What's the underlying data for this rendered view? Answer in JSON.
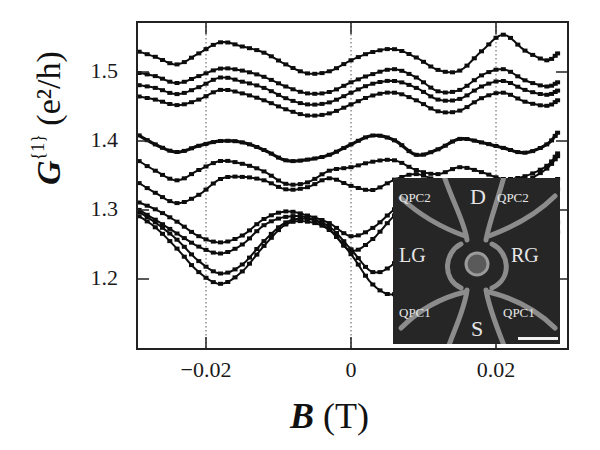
{
  "axes": {
    "ylabel_main": "G",
    "ylabel_sup": "{1}",
    "ylabel_unit": " (e²/h)",
    "xlabel_main": "B",
    "xlabel_unit": " (T)",
    "yticks": [
      {
        "label": "1.5",
        "value": 1.5
      },
      {
        "label": "1.4",
        "value": 1.4
      },
      {
        "label": "1.3",
        "value": 1.3
      },
      {
        "label": "1.2",
        "value": 1.2
      }
    ],
    "xticks": [
      {
        "label": "−0.02",
        "value": -0.02
      },
      {
        "label": "0",
        "value": 0
      },
      {
        "label": "0.02",
        "value": 0.02
      }
    ]
  },
  "inset": {
    "labels": {
      "d": "D",
      "s": "S",
      "lg": "LG",
      "rg": "RG",
      "qpc2_left": "QPC2",
      "qpc2_right": "QPC2",
      "qpc1_left": "QPC1",
      "qpc1_right": "QPC1"
    },
    "background": "#262626",
    "gate_color": "#8a8a8a"
  },
  "chart_data": {
    "type": "line",
    "title": "",
    "xlabel": "B (T)",
    "ylabel": "G{1} (e²/h)",
    "xlim": [
      -0.0305,
      0.0285
    ],
    "ylim": [
      1.13,
      1.57
    ],
    "grid": "dotted vertical lines at x = -0.02, 0, 0.02",
    "legend": "none",
    "annotations": [
      "Inset: device micrograph with labels QPC2, D, QPC2, LG, RG, QPC1, S, QPC1 and scale bar"
    ],
    "x": [
      -0.03,
      -0.027,
      -0.024,
      -0.021,
      -0.018,
      -0.015,
      -0.012,
      -0.009,
      -0.006,
      -0.003,
      0.0,
      0.003,
      0.006,
      0.009,
      0.012,
      0.015,
      0.018,
      0.021,
      0.024,
      0.027,
      0.0285
    ],
    "series": [
      {
        "name": "curve 1",
        "values": [
          1.532,
          1.522,
          1.511,
          1.527,
          1.543,
          1.537,
          1.528,
          1.511,
          1.498,
          1.501,
          1.517,
          1.529,
          1.533,
          1.521,
          1.503,
          1.502,
          1.53,
          1.554,
          1.531,
          1.517,
          1.527
        ]
      },
      {
        "name": "curve 2",
        "values": [
          1.5,
          1.494,
          1.484,
          1.494,
          1.505,
          1.502,
          1.493,
          1.479,
          1.469,
          1.471,
          1.485,
          1.497,
          1.504,
          1.492,
          1.472,
          1.474,
          1.495,
          1.504,
          1.488,
          1.479,
          1.485
        ]
      },
      {
        "name": "curve 3",
        "values": [
          1.482,
          1.477,
          1.468,
          1.478,
          1.492,
          1.486,
          1.477,
          1.462,
          1.453,
          1.456,
          1.47,
          1.483,
          1.487,
          1.477,
          1.46,
          1.461,
          1.479,
          1.487,
          1.474,
          1.467,
          1.473
        ]
      },
      {
        "name": "curve 4",
        "values": [
          1.466,
          1.46,
          1.452,
          1.46,
          1.474,
          1.469,
          1.459,
          1.446,
          1.437,
          1.44,
          1.453,
          1.466,
          1.47,
          1.459,
          1.443,
          1.444,
          1.462,
          1.47,
          1.457,
          1.451,
          1.459
        ]
      },
      {
        "name": "curve 5 (bold)",
        "values": [
          1.413,
          1.395,
          1.384,
          1.393,
          1.4,
          1.398,
          1.387,
          1.372,
          1.373,
          1.38,
          1.395,
          1.408,
          1.401,
          1.38,
          1.388,
          1.403,
          1.398,
          1.39,
          1.383,
          1.395,
          1.412
        ]
      },
      {
        "name": "curve 6",
        "values": [
          1.376,
          1.357,
          1.343,
          1.358,
          1.371,
          1.367,
          1.356,
          1.338,
          1.34,
          1.357,
          1.362,
          1.37,
          1.372,
          1.358,
          1.352,
          1.362,
          1.355,
          1.345,
          1.349,
          1.364,
          1.382
        ]
      },
      {
        "name": "curve 7",
        "values": [
          1.344,
          1.325,
          1.31,
          1.322,
          1.345,
          1.348,
          1.343,
          1.33,
          1.333,
          1.346,
          1.335,
          1.329,
          1.344,
          1.352,
          1.341,
          1.325,
          1.316,
          1.319,
          1.34,
          1.36,
          1.378
        ]
      },
      {
        "name": "curve 8",
        "values": [
          1.314,
          1.301,
          1.283,
          1.262,
          1.253,
          1.263,
          1.287,
          1.298,
          1.292,
          1.281,
          1.262,
          1.274,
          1.301,
          1.32,
          1.319,
          1.298,
          1.268,
          1.262,
          1.29,
          1.323,
          1.345
        ]
      },
      {
        "name": "curve 9",
        "values": [
          1.305,
          1.286,
          1.266,
          1.247,
          1.237,
          1.25,
          1.278,
          1.29,
          1.289,
          1.272,
          1.241,
          1.258,
          1.292,
          1.314,
          1.309,
          1.281,
          1.25,
          1.247,
          1.276,
          1.309,
          1.33
        ]
      },
      {
        "name": "curve 10",
        "values": [
          1.302,
          1.282,
          1.257,
          1.226,
          1.208,
          1.221,
          1.255,
          1.282,
          1.287,
          1.276,
          1.243,
          1.21,
          1.223,
          1.26,
          1.29,
          1.27,
          1.232,
          1.194,
          1.212,
          1.252,
          1.282
        ]
      },
      {
        "name": "curve 11",
        "values": [
          1.296,
          1.275,
          1.244,
          1.21,
          1.193,
          1.211,
          1.248,
          1.279,
          1.283,
          1.271,
          1.236,
          1.192,
          1.178,
          1.208,
          1.252,
          1.255,
          1.218,
          1.18,
          1.2,
          1.24,
          1.268
        ]
      }
    ]
  }
}
